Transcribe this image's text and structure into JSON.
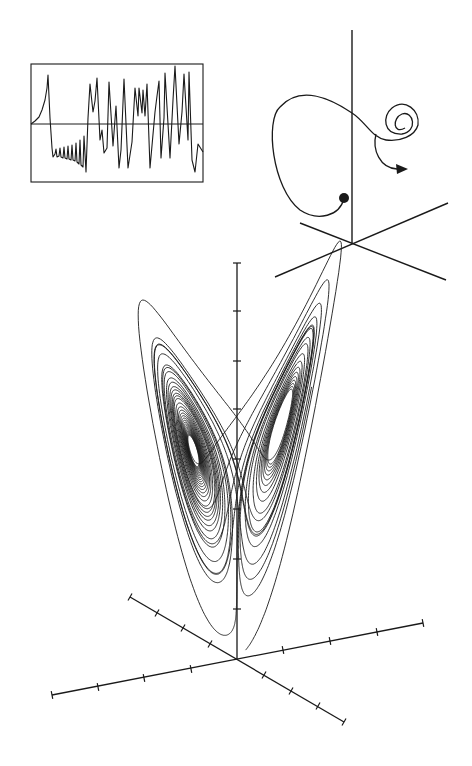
{
  "figure": {
    "title": "Lorenz attractor",
    "background": "#ffffff",
    "ink_color": "#1a1a1a"
  },
  "chart_data": [
    {
      "id": "time-series-inset",
      "type": "line",
      "title": "",
      "xlabel": "",
      "ylabel": "",
      "grid": false,
      "legend": null,
      "frame": {
        "x": 31,
        "y": 64,
        "w": 172,
        "h": 118
      },
      "baseline_y": 124,
      "description": "Time series of one Lorenz variable: initial exponential rise to a spike, then ~8 small growing oscillations below baseline, then irregular large chaotic swings crossing baseline",
      "points": [
        [
          31,
          124
        ],
        [
          35,
          121
        ],
        [
          39,
          117
        ],
        [
          42,
          110
        ],
        [
          45,
          100
        ],
        [
          47,
          88
        ],
        [
          48,
          75
        ],
        [
          50,
          118
        ],
        [
          52,
          148
        ],
        [
          53,
          157
        ],
        [
          55,
          154
        ],
        [
          56,
          149
        ],
        [
          57,
          157
        ],
        [
          59,
          156
        ],
        [
          60,
          148
        ],
        [
          61,
          157
        ],
        [
          63,
          158
        ],
        [
          64,
          147
        ],
        [
          65,
          158
        ],
        [
          67,
          159
        ],
        [
          68,
          146
        ],
        [
          69,
          159
        ],
        [
          71,
          160
        ],
        [
          72,
          145
        ],
        [
          73,
          160
        ],
        [
          75,
          161
        ],
        [
          76,
          143
        ],
        [
          77,
          162
        ],
        [
          79,
          164
        ],
        [
          80,
          140
        ],
        [
          81,
          165
        ],
        [
          83,
          167
        ],
        [
          84,
          136
        ],
        [
          86,
          172
        ],
        [
          88,
          118
        ],
        [
          90,
          84
        ],
        [
          93,
          112
        ],
        [
          95,
          101
        ],
        [
          97,
          78
        ],
        [
          100,
          140
        ],
        [
          102,
          130
        ],
        [
          104,
          153
        ],
        [
          107,
          148
        ],
        [
          109,
          82
        ],
        [
          113,
          146
        ],
        [
          116,
          106
        ],
        [
          119,
          168
        ],
        [
          121,
          150
        ],
        [
          124,
          79
        ],
        [
          128,
          168
        ],
        [
          132,
          142
        ],
        [
          135,
          88
        ],
        [
          138,
          116
        ],
        [
          139,
          88
        ],
        [
          142,
          113
        ],
        [
          143,
          90
        ],
        [
          145,
          116
        ],
        [
          147,
          84
        ],
        [
          150,
          168
        ],
        [
          155,
          112
        ],
        [
          157,
          96
        ],
        [
          159,
          81
        ],
        [
          161,
          158
        ],
        [
          164,
          118
        ],
        [
          165,
          73
        ],
        [
          170,
          158
        ],
        [
          173,
          100
        ],
        [
          175,
          66
        ],
        [
          179,
          144
        ],
        [
          182,
          112
        ],
        [
          184,
          74
        ],
        [
          188,
          140
        ],
        [
          189,
          72
        ],
        [
          192,
          160
        ],
        [
          195,
          172
        ],
        [
          198,
          144
        ],
        [
          203,
          152
        ]
      ]
    },
    {
      "id": "lorenz-attractor-main",
      "type": "line",
      "title": "",
      "xlabel": "",
      "ylabel": "",
      "grid": false,
      "legend": null,
      "system": {
        "sigma": 10,
        "rho": 28,
        "beta": 2.6667
      },
      "initial_state": [
        0.05,
        0.0,
        0.5
      ],
      "integration": {
        "dt": 0.004,
        "steps": 9000,
        "skip": 100
      },
      "projection": {
        "origin_px": [
          237,
          659
        ],
        "ex": [
          6.05,
          -1.0
        ],
        "ey": [
          -0.9,
          -0.52
        ],
        "ez": [
          0.0,
          -8.2
        ],
        "shift_z": 0
      },
      "axes": [
        {
          "name": "axis-1",
          "from": [
            52,
            695
          ],
          "to": [
            423,
            623
          ],
          "ticks": [
            [
              52,
              695
            ],
            [
              98,
              687
            ],
            [
              144,
              678
            ],
            [
              191,
              669
            ],
            [
              283,
              650
            ],
            [
              330,
              641
            ],
            [
              377,
              632
            ],
            [
              423,
              623
            ]
          ]
        },
        {
          "name": "axis-2",
          "from": [
            130,
            597
          ],
          "to": [
            344,
            722
          ],
          "ticks": [
            [
              130,
              597
            ],
            [
              157,
              613
            ],
            [
              183,
              628
            ],
            [
              210,
              644
            ],
            [
              264,
              675
            ],
            [
              291,
              691
            ],
            [
              318,
              706
            ],
            [
              344,
              722
            ]
          ]
        },
        {
          "name": "axis-z",
          "from": [
            237,
            659
          ],
          "to": [
            237,
            263
          ],
          "ticks": [
            [
              237,
              263
            ],
            [
              237,
              311
            ],
            [
              237,
              361
            ],
            [
              237,
              409
            ],
            [
              237,
              459
            ],
            [
              237,
              509
            ],
            [
              237,
              559
            ],
            [
              237,
              609
            ]
          ]
        }
      ]
    },
    {
      "id": "trajectory-inset-3d",
      "type": "line",
      "title": "",
      "grid": false,
      "legend": null,
      "axes": [
        {
          "name": "inset-axis-z",
          "from": [
            352,
            30
          ],
          "to": [
            352,
            243
          ]
        },
        {
          "name": "inset-axis-1",
          "from": [
            275,
            277
          ],
          "to": [
            448,
            203
          ]
        },
        {
          "name": "inset-axis-2",
          "from": [
            300,
            223
          ],
          "to": [
            446,
            280
          ]
        }
      ],
      "start_point": [
        344,
        198
      ],
      "path": "M344,198 C340,216 318,222 300,210 C272,188 265,120 280,107 C300,85 330,98 352,113 C366,122 372,138 386,140 C400,142 415,136 418,125 C420,110 405,98 392,108 C382,116 383,135 402,134 C418,132 414,110 402,114 C392,118 393,135 405,128 M376,134 C372,150 380,168 397,169",
      "arrow_tip": [
        408,
        169
      ]
    }
  ]
}
